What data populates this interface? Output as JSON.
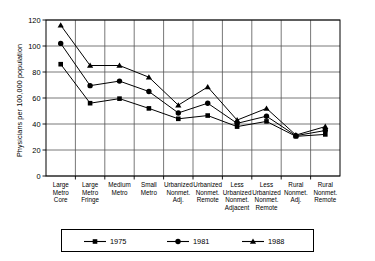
{
  "chart_data": {
    "type": "line",
    "title": "",
    "subtitle": "",
    "xlabel": "",
    "ylabel": "Physicians per 100,000 population",
    "ylim": [
      0,
      120
    ],
    "yticks": [
      0,
      20,
      40,
      60,
      80,
      100,
      120
    ],
    "ytick_labels": [
      "0",
      "20",
      "40",
      "60",
      "80",
      "100",
      "120"
    ],
    "grid": true,
    "legend_position": "bottom",
    "markers": {
      "1975": "square",
      "1981": "circle",
      "1988": "triangle"
    },
    "categories": [
      "Large Metro Core",
      "Large Metro Fringe",
      "Medium Metro",
      "Small Metro",
      "Urbanized Nonmet. Adj.",
      "Urbanized Nonmet. Remote",
      "Less Urbanized Nonmet. Adjacent",
      "Less Urbanized Nonmet. Remote",
      "Rural Nonmet. Adj.",
      "Rural Nonmet. Remote"
    ],
    "category_lines": [
      [
        "Large",
        "Metro",
        "Core"
      ],
      [
        "Large",
        "Metro",
        "Fringe"
      ],
      [
        "Medium",
        "Metro"
      ],
      [
        "Small",
        "Metro"
      ],
      [
        "Urbanized",
        "Nonmet.",
        "Adj."
      ],
      [
        "Urbanized",
        "Nonmet.",
        "Remote"
      ],
      [
        "Less",
        "Urbanized",
        "Nonmet.",
        "Adjacent"
      ],
      [
        "Less",
        "Urbanized",
        "Nonmet.",
        "Remote"
      ],
      [
        "Rural",
        "Nonmet.",
        "Adj."
      ],
      [
        "Rural",
        "Nonmet.",
        "Remote"
      ]
    ],
    "series": [
      {
        "name": "1975",
        "marker": "square",
        "values": [
          86,
          56,
          59.5,
          52,
          44,
          46.5,
          38,
          42,
          30.5,
          32
        ]
      },
      {
        "name": "1981",
        "marker": "circle",
        "values": [
          102,
          69.5,
          73,
          65,
          48.5,
          56,
          40.5,
          46,
          31,
          35
        ]
      },
      {
        "name": "1988",
        "marker": "triangle",
        "values": [
          116,
          85,
          85,
          76,
          54.5,
          68.5,
          43,
          52,
          31.5,
          38
        ]
      }
    ]
  },
  "legend": {
    "entries": [
      {
        "label": "1975",
        "marker": "square"
      },
      {
        "label": "1981",
        "marker": "circle"
      },
      {
        "label": "1988",
        "marker": "triangle"
      }
    ]
  }
}
